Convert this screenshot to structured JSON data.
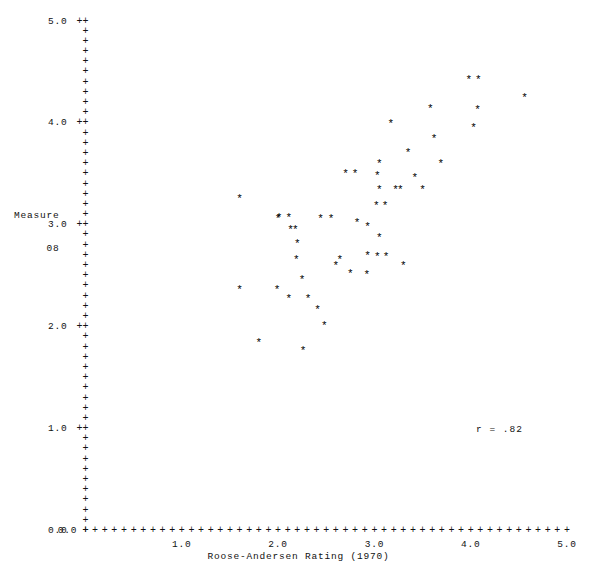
{
  "chart_data": {
    "type": "scatter",
    "title": "",
    "xlabel": "Roose-Andersen Rating (1970)",
    "ylabel": "Measure 08",
    "ylabel_lines": [
      "Measure",
      "08"
    ],
    "annotation": "r = .82",
    "correlation": 0.82,
    "xlim": [
      0.0,
      5.0
    ],
    "ylim": [
      0.0,
      5.0
    ],
    "grid": false,
    "legend": null,
    "axis_glyph": "+",
    "marker_glyph": "*",
    "xticks": [
      0.0,
      1.0,
      2.0,
      3.0,
      4.0,
      5.0
    ],
    "yticks": [
      0.0,
      1.0,
      2.0,
      3.0,
      4.0,
      5.0
    ],
    "xtick_labels": [
      "0.0",
      "1.0",
      "2.0",
      "3.0",
      "4.0",
      "5.0"
    ],
    "ytick_labels": [
      "0.0",
      "1.0",
      "2.0",
      "3.0",
      "4.0",
      "5.0"
    ],
    "xtick_minor_step": 0.1,
    "ytick_minor_step": 0.1,
    "points": [
      {
        "x": 1.6,
        "y": 3.29
      },
      {
        "x": 1.6,
        "y": 2.39
      },
      {
        "x": 2.0,
        "y": 3.09
      },
      {
        "x": 1.99,
        "y": 2.39
      },
      {
        "x": 1.8,
        "y": 1.87
      },
      {
        "x": 2.01,
        "y": 3.1
      },
      {
        "x": 2.11,
        "y": 3.1
      },
      {
        "x": 2.13,
        "y": 2.98
      },
      {
        "x": 2.18,
        "y": 2.98
      },
      {
        "x": 2.2,
        "y": 2.85
      },
      {
        "x": 2.19,
        "y": 2.69
      },
      {
        "x": 2.25,
        "y": 2.49
      },
      {
        "x": 2.11,
        "y": 2.31
      },
      {
        "x": 2.31,
        "y": 2.31
      },
      {
        "x": 2.26,
        "y": 1.8
      },
      {
        "x": 2.41,
        "y": 2.2
      },
      {
        "x": 2.44,
        "y": 3.09
      },
      {
        "x": 2.55,
        "y": 3.09
      },
      {
        "x": 2.6,
        "y": 2.63
      },
      {
        "x": 2.7,
        "y": 3.53
      },
      {
        "x": 2.8,
        "y": 3.53
      },
      {
        "x": 2.64,
        "y": 2.69
      },
      {
        "x": 2.75,
        "y": 2.55
      },
      {
        "x": 2.93,
        "y": 2.73
      },
      {
        "x": 2.92,
        "y": 2.54
      },
      {
        "x": 2.93,
        "y": 3.01
      },
      {
        "x": 3.05,
        "y": 3.63
      },
      {
        "x": 3.03,
        "y": 3.51
      },
      {
        "x": 3.05,
        "y": 3.38
      },
      {
        "x": 3.02,
        "y": 3.22
      },
      {
        "x": 3.03,
        "y": 2.72
      },
      {
        "x": 3.12,
        "y": 2.72
      },
      {
        "x": 3.11,
        "y": 3.22
      },
      {
        "x": 3.17,
        "y": 4.02
      },
      {
        "x": 3.22,
        "y": 3.38
      },
      {
        "x": 3.27,
        "y": 3.38
      },
      {
        "x": 3.3,
        "y": 2.63
      },
      {
        "x": 3.35,
        "y": 3.74
      },
      {
        "x": 3.42,
        "y": 3.49
      },
      {
        "x": 3.5,
        "y": 3.38
      },
      {
        "x": 3.58,
        "y": 4.17
      },
      {
        "x": 3.62,
        "y": 3.88
      },
      {
        "x": 3.69,
        "y": 3.63
      },
      {
        "x": 3.98,
        "y": 4.46
      },
      {
        "x": 4.08,
        "y": 4.46
      },
      {
        "x": 4.07,
        "y": 4.16
      },
      {
        "x": 4.03,
        "y": 3.98
      },
      {
        "x": 4.56,
        "y": 4.28
      },
      {
        "x": 2.48,
        "y": 2.04
      },
      {
        "x": 3.05,
        "y": 2.9
      },
      {
        "x": 2.82,
        "y": 3.05
      }
    ]
  }
}
